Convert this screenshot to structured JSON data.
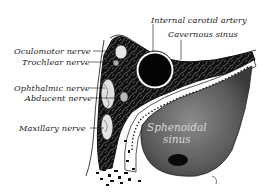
{
  "figure": {
    "labels": {
      "internal_carotid_artery": "Internal carotid artery",
      "cavernous_sinus": "Cavernous sinus",
      "oculomotor_nerve": "Oculomotor nerve",
      "trochlear_nerve": "Trochlear nerve",
      "ophthalmic_nerve": "Ophthalmic nerve",
      "abducent_nerve": "Abducent nerve",
      "maxillary_nerve": "Maxillary nerve",
      "sphenoidal_sinus_line1": "Sphenoidal",
      "sphenoidal_sinus_line2": "sinus"
    },
    "colors": {
      "ink": "#111111",
      "paper": "#ffffff",
      "sinus_fill": "#6e6e6e",
      "label_text": "#1a1a1a",
      "inner_label_text": "#d8d8d8"
    }
  }
}
